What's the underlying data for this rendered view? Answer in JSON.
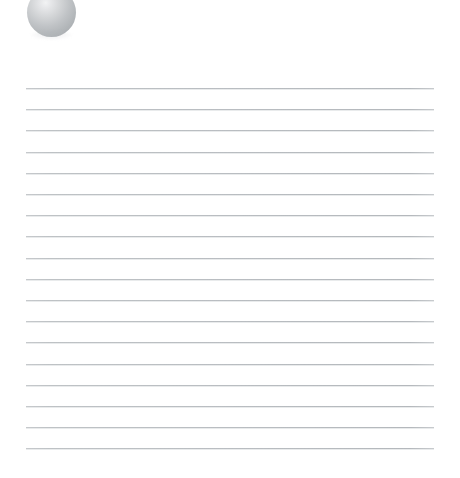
{
  "page": {
    "background_color": "#ffffff",
    "width": 460,
    "height": 478
  },
  "orb": {
    "name": "gray-sphere-graphic",
    "shape": "circle",
    "highlight_color": "#f2f3f4",
    "mid_color": "#c0c3c6",
    "edge_color": "#a2a6aa",
    "diameter_px": 49,
    "center_x_px": 51,
    "cropped_at_top": true
  },
  "ruled_lines": {
    "name": "horizontal-ruled-lines",
    "count": 18,
    "color": "#b9bdc1",
    "thickness_px": 1,
    "spacing_px": 21.2,
    "start_y_px": 88,
    "left_x_px": 26,
    "right_x_px": 434
  }
}
